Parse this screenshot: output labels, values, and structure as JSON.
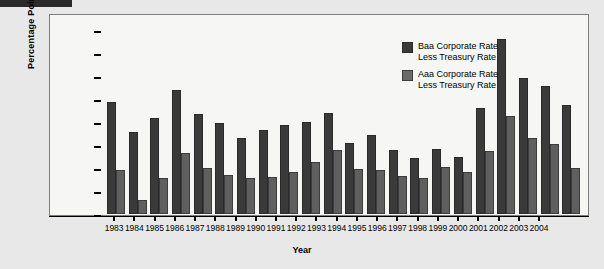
{
  "chart_data": {
    "type": "bar",
    "title": "",
    "xlabel": "Year",
    "ylabel": "Percentage Points",
    "ylim": [
      0,
      4.25
    ],
    "yticks": [
      "0",
      "0.5",
      "1.0",
      "1.5",
      "2.0",
      "2.5",
      "3.0",
      "3.5",
      "4.0"
    ],
    "ytick_values": [
      0,
      0.5,
      1.0,
      1.5,
      2.0,
      2.5,
      3.0,
      3.5,
      4.0
    ],
    "grid": false,
    "legend_position": "top-right",
    "categories": [
      "1983",
      "1984",
      "1985",
      "1986",
      "1987",
      "1988",
      "1989",
      "1990",
      "1991",
      "1992",
      "1993",
      "1994",
      "1995",
      "1996",
      "1997",
      "1998",
      "1999",
      "2000",
      "2001",
      "2002",
      "2003",
      "2004"
    ],
    "series": [
      {
        "name": "Baa Corporate Rate Less Treasury Rate",
        "color": "#3a3a3a",
        "values": [
          2.45,
          1.78,
          2.1,
          2.7,
          2.18,
          1.98,
          1.65,
          1.83,
          1.95,
          2.0,
          2.2,
          1.55,
          1.72,
          1.4,
          1.22,
          1.42,
          1.25,
          2.3,
          3.82,
          2.97,
          2.8,
          2.38
        ]
      },
      {
        "name": "Aaa Corporate Rate Less Treasury Rate",
        "color": "#6a6a6a",
        "values": [
          0.95,
          0.3,
          0.78,
          1.33,
          1.0,
          0.85,
          0.78,
          0.8,
          0.92,
          1.13,
          1.4,
          0.98,
          0.95,
          0.82,
          0.78,
          1.02,
          0.92,
          1.38,
          2.13,
          1.65,
          1.52,
          1.0
        ]
      }
    ]
  },
  "legend": {
    "items": [
      {
        "line1": "Baa Corporate Rate",
        "line2": "Less Treasury Rate",
        "swatch": "baa"
      },
      {
        "line1": "Aaa Corporate Rate",
        "line2": "Less Treasury Rate",
        "swatch": "aaa"
      }
    ]
  }
}
